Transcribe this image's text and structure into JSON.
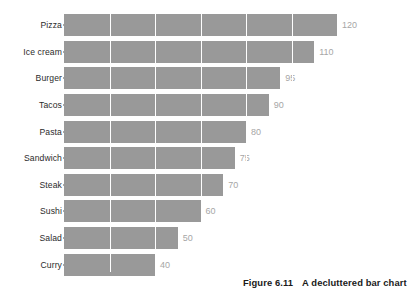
{
  "caption": {
    "figure_number": "Figure 6.11",
    "text": "A decluttered bar chart"
  },
  "style": {
    "bar_color": "#999999",
    "gridline_color": "#ffffff",
    "value_label_color": "#a6a6a6",
    "category_label_color": "#2b2b2b",
    "background": "#ffffff"
  },
  "chart_data": {
    "type": "bar",
    "orientation": "horizontal",
    "title": "",
    "xlabel": "",
    "ylabel": "",
    "categories": [
      "Pizza",
      "Ice cream",
      "Burger",
      "Tacos",
      "Pasta",
      "Sandwich",
      "Steak",
      "Sushi",
      "Salad",
      "Curry"
    ],
    "values": [
      120,
      110,
      95,
      90,
      80,
      75,
      70,
      60,
      50,
      40
    ],
    "value_labels": [
      "120",
      "110",
      "95",
      "90",
      "80",
      "75",
      "70",
      "60",
      "50",
      "40"
    ],
    "xlim": [
      0,
      120
    ],
    "grid": "vertical",
    "gridline_values": [
      20,
      40,
      60,
      80,
      100
    ],
    "legend": "none",
    "data_labels": true
  }
}
